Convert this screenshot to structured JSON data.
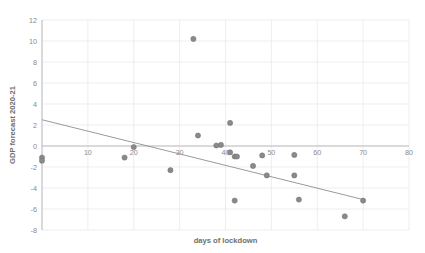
{
  "chart_data": {
    "type": "scatter",
    "title": "",
    "xlabel": "days of lockdown",
    "ylabel": "GDP forecast 2020-21",
    "xlim": [
      0,
      80
    ],
    "ylim": [
      -8,
      12
    ],
    "xticks": [
      0,
      10,
      20,
      30,
      40,
      50,
      60,
      70,
      80
    ],
    "xtick_labels": [
      "",
      "10",
      "20",
      "30",
      "40",
      "50",
      "60",
      "70",
      "80"
    ],
    "yticks": [
      -8,
      -6,
      -4,
      -2,
      0,
      2,
      4,
      6,
      8,
      10,
      12
    ],
    "ytick_labels": [
      "-8",
      "-6",
      "-4",
      "-2",
      "0",
      "2",
      "4",
      "6",
      "8",
      "10",
      "12"
    ],
    "grid": true,
    "legend": "none",
    "marker_color": "#8a8a8a",
    "trendline_color": "#8f8f8f",
    "points": [
      {
        "x": 0,
        "y": -1.1
      },
      {
        "x": 0,
        "y": -1.4
      },
      {
        "x": 18,
        "y": -1.1
      },
      {
        "x": 20,
        "y": -0.1
      },
      {
        "x": 28,
        "y": -2.3
      },
      {
        "x": 33,
        "y": 10.2
      },
      {
        "x": 34,
        "y": 1.0
      },
      {
        "x": 38,
        "y": 0.05
      },
      {
        "x": 39,
        "y": 0.1
      },
      {
        "x": 41,
        "y": 2.2
      },
      {
        "x": 41,
        "y": -0.6
      },
      {
        "x": 42,
        "y": -1.0
      },
      {
        "x": 42.5,
        "y": -1.0
      },
      {
        "x": 42,
        "y": -5.2
      },
      {
        "x": 46,
        "y": -1.9
      },
      {
        "x": 48,
        "y": -0.9
      },
      {
        "x": 49,
        "y": -2.8
      },
      {
        "x": 55,
        "y": -0.85
      },
      {
        "x": 55,
        "y": -2.8
      },
      {
        "x": 56,
        "y": -5.1
      },
      {
        "x": 66,
        "y": -6.7
      },
      {
        "x": 70,
        "y": -5.2
      }
    ],
    "trendline": {
      "x_start": 0,
      "y_start": 2.5,
      "x_end": 70,
      "y_end": -5.1
    }
  }
}
